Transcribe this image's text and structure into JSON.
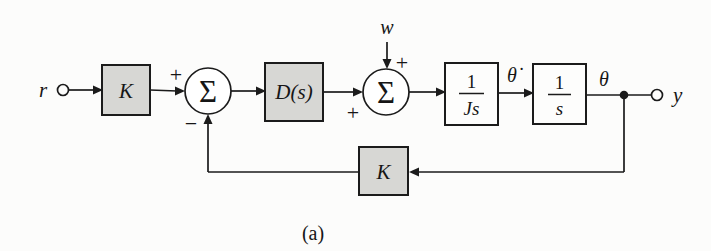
{
  "figure": {
    "caption": "(a)",
    "terminals": {
      "input_label": "r",
      "output_label": "y",
      "disturbance_label": "w"
    },
    "signals": {
      "theta_dot": "θ̇",
      "theta": "θ"
    },
    "summing_junctions": {
      "sigma_symbol": "Σ",
      "sum1_plus": "+",
      "sum1_minus": "−",
      "sum2_plus_input": "+",
      "sum2_plus_disturbance": "+"
    },
    "blocks": {
      "forward_gain_label": "K",
      "controller_label": "D(s)",
      "inertia_numerator": "1",
      "inertia_denominator": "Js",
      "integrator_numerator": "1",
      "integrator_denominator": "s",
      "feedback_gain_label": "K"
    },
    "colors": {
      "shaded_block_fill": "#d7d7d4",
      "white_block_fill": "#fdfdfc",
      "line_color": "#1b1b1b",
      "background": "#fcfcfb"
    }
  }
}
